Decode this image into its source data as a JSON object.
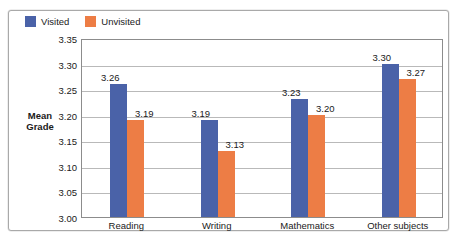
{
  "chart_data": {
    "type": "bar",
    "title": "",
    "subtitle": "",
    "xlabel": "",
    "ylabel": "Mean\nGrade",
    "ylim": [
      3.0,
      3.35
    ],
    "ytick_step": 0.05,
    "ytick_labels": [
      "3.35",
      "3.30",
      "3.25",
      "3.20",
      "3.15",
      "3.10",
      "3.05",
      "3.00"
    ],
    "ytick_values": [
      3.35,
      3.3,
      3.25,
      3.2,
      3.15,
      3.1,
      3.05,
      3.0
    ],
    "grid": true,
    "grid_axis": "y",
    "legend_position": "top-left-inside",
    "categories": [
      "Reading",
      "Writing",
      "Mathematics",
      "Other subjects"
    ],
    "series": [
      {
        "name": "Visited",
        "color": "#4A62A8",
        "values": [
          3.26,
          3.19,
          3.23,
          3.3
        ],
        "labels": [
          "3.26",
          "3.19",
          "3.23",
          "3.30"
        ]
      },
      {
        "name": "Unvisited",
        "color": "#ED7D45",
        "values": [
          3.19,
          3.13,
          3.2,
          3.27
        ],
        "labels": [
          "3.19",
          "3.13",
          "3.20",
          "3.27"
        ]
      }
    ]
  },
  "colors": {
    "visited": "#4A62A8",
    "unvisited": "#ED7D45",
    "gridline": "#b9b9b9",
    "plot_border": "#8c8c8c",
    "frame_border": "#a9a9a9",
    "text": "#1a1a1a",
    "background": "#ffffff"
  }
}
